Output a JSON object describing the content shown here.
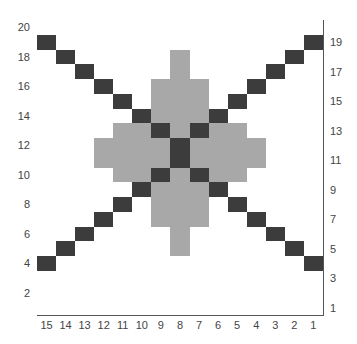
{
  "chart": {
    "columns": 15,
    "rows": 20,
    "colors": {
      "empty": "#ffffff",
      "light": "#a8a8a8",
      "dark": "#3c3c3c",
      "grid": "#555555"
    },
    "legend_key": {
      ".": "empty",
      "L": "light",
      "D": "dark"
    },
    "grid_top_to_bottom": [
      "...............",
      "D.............D",
      ".D.....L.....D.",
      "..D....L....D..",
      "...D..LLL..D...",
      "....D.LLL.D....",
      ".....DLLLD.....",
      "....LLDLDLL....",
      "...LLLLDLLLL...",
      "...LLLLDLLLL...",
      "....LLDLDLL....",
      ".....DLLLD.....",
      "....D.LLL.D....",
      "...D..LLL..D...",
      "..D....L....D..",
      ".D.....L.....D.",
      "D.............D",
      "...............",
      "...............",
      "..............."
    ],
    "left_row_labels": [
      "20",
      "18",
      "16",
      "14",
      "12",
      "10",
      "8",
      "6",
      "4",
      "2"
    ],
    "right_row_labels": [
      "19",
      "17",
      "15",
      "13",
      "11",
      "9",
      "7",
      "5",
      "3",
      "1"
    ],
    "column_labels": [
      "15",
      "14",
      "13",
      "12",
      "11",
      "10",
      "9",
      "8",
      "7",
      "6",
      "5",
      "4",
      "3",
      "2",
      "1"
    ]
  }
}
